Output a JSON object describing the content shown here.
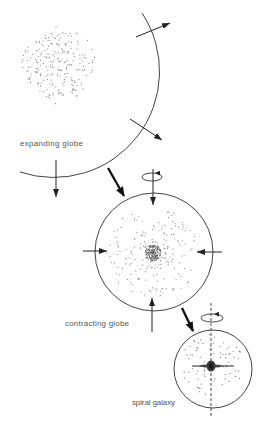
{
  "figure": {
    "stages": [
      {
        "id": "expanding",
        "label": "expanding globe"
      },
      {
        "id": "contracting",
        "label": "contracting globe"
      },
      {
        "id": "spiral",
        "label": "spiral galaxy"
      }
    ]
  },
  "colors": {
    "line": "#2e2e2e",
    "dots": "#5a5a5a",
    "label": "#555555",
    "background": "#ffffff"
  },
  "star_fields": {
    "expanding": {
      "cx": 58,
      "cy": 65,
      "radius": 36,
      "count": 230,
      "profile": "uniform"
    },
    "contracting": {
      "cx": 153,
      "cy": 253,
      "radius": 46,
      "count": 380,
      "profile": "concentrated"
    },
    "spiral": {
      "cx": 212,
      "cy": 364,
      "radius": 31,
      "count": 75,
      "profile": "halo-disk"
    }
  }
}
